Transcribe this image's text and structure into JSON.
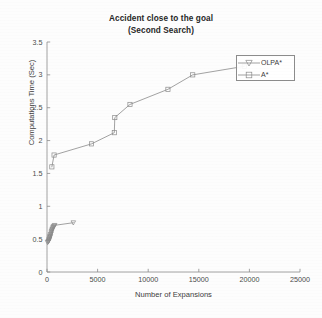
{
  "chart_data": {
    "type": "line",
    "title": "Accident close to the goal",
    "subtitle": "(Second Search)",
    "xlabel": "Number of Expansions",
    "ylabel": "Computations Time (Sec)",
    "xlim": [
      0,
      25000
    ],
    "ylim": [
      0,
      3.5
    ],
    "xticks": [
      0,
      5000,
      10000,
      15000,
      20000,
      25000
    ],
    "xticklabels": [
      "0",
      "5000",
      "10000",
      "15000",
      "20000",
      "25000"
    ],
    "yticks": [
      0,
      0.5,
      1,
      1.5,
      2,
      2.5,
      3,
      3.5
    ],
    "yticklabels": [
      "0",
      "0.5",
      "1",
      "1.5",
      "2",
      "2.5",
      "3",
      "3.5"
    ],
    "grid": false,
    "legend_position": "upper right",
    "series": [
      {
        "name": "OLPA*",
        "marker": "triangle-down",
        "color": "#8a8a8a",
        "points": [
          [
            60,
            0.45
          ],
          [
            110,
            0.46
          ],
          [
            150,
            0.47
          ],
          [
            190,
            0.48
          ],
          [
            215,
            0.5
          ],
          [
            240,
            0.5
          ],
          [
            265,
            0.52
          ],
          [
            285,
            0.53
          ],
          [
            300,
            0.55
          ],
          [
            330,
            0.54
          ],
          [
            360,
            0.57
          ],
          [
            390,
            0.58
          ],
          [
            420,
            0.6
          ],
          [
            450,
            0.62
          ],
          [
            480,
            0.63
          ],
          [
            520,
            0.65
          ],
          [
            560,
            0.66
          ],
          [
            600,
            0.68
          ],
          [
            650,
            0.69
          ],
          [
            700,
            0.7
          ],
          [
            760,
            0.71
          ],
          [
            2600,
            0.75
          ]
        ]
      },
      {
        "name": "A*",
        "marker": "square",
        "color": "#8a8a8a",
        "points": [
          [
            480,
            1.6
          ],
          [
            700,
            1.78
          ],
          [
            4400,
            1.95
          ],
          [
            6650,
            2.12
          ],
          [
            6700,
            2.35
          ],
          [
            8200,
            2.55
          ],
          [
            11950,
            2.78
          ],
          [
            14400,
            3.0
          ],
          [
            19500,
            3.13
          ]
        ]
      }
    ]
  },
  "legend": {
    "entries": [
      {
        "label": "OLPA*",
        "marker": "triangle-down"
      },
      {
        "label": "A*",
        "marker": "square"
      }
    ]
  }
}
